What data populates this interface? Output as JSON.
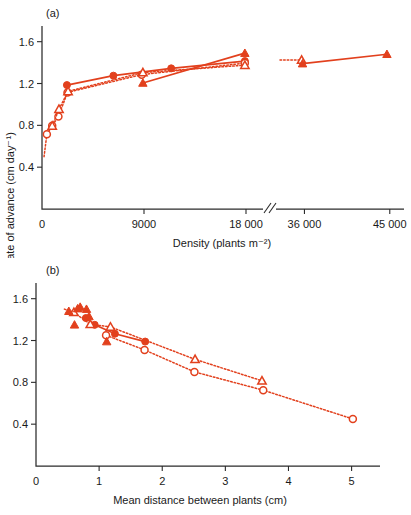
{
  "figure": {
    "accent_color": "#e2401d",
    "axis_color": "#2b2b2b",
    "shared_ylabel": "Rate of advance (cm day⁻¹)"
  },
  "panel_a": {
    "label": "(a)",
    "xlabel": "Density (plants m⁻²)",
    "ylabel": "Rate of advance (cm day⁻¹)",
    "xticks": [
      "0",
      "9000",
      "18 000",
      "36 000",
      "45 000"
    ],
    "yticks": [
      "0.4",
      "0.8",
      "1.2",
      "1.6"
    ]
  },
  "panel_b": {
    "label": "(b)",
    "xlabel": "Mean distance between plants (cm)",
    "ylabel": "Rate of advance (cm day⁻¹)",
    "xticks": [
      "0",
      "1",
      "2",
      "3",
      "4",
      "5"
    ],
    "yticks": [
      "0.4",
      "0.8",
      "1.2",
      "1.6"
    ]
  },
  "chart_data": [
    {
      "type": "scatter",
      "panel": "(a)",
      "title": "",
      "xlabel": "Density (plants m⁻²)",
      "ylabel": "Rate of advance (cm day⁻¹)",
      "xlim": [
        0,
        19500
      ],
      "xlim_right_segment": [
        33000,
        46500
      ],
      "ylim": [
        0,
        1.75
      ],
      "ytick_values": [
        0.4,
        0.8,
        1.2,
        1.6
      ],
      "xtick_values": [
        0,
        9000,
        18000,
        36000,
        45000
      ],
      "axis_break": true,
      "axis_break_between": [
        19500,
        33000
      ],
      "grid": false,
      "legend": "none",
      "series": [
        {
          "name": "filled-circles",
          "marker": "filled circle",
          "line": "solid",
          "points": [
            {
              "x": 2200,
              "y": 1.185
            },
            {
              "x": 6300,
              "y": 1.275
            },
            {
              "x": 11400,
              "y": 1.345
            },
            {
              "x": 17900,
              "y": 1.415
            }
          ]
        },
        {
          "name": "open-circles",
          "marker": "open circle",
          "line": "dotted",
          "points": [
            {
              "x": 430,
              "y": 0.715
            },
            {
              "x": 900,
              "y": 0.795
            },
            {
              "x": 1450,
              "y": 0.885
            },
            {
              "x": 2250,
              "y": 1.115
            },
            {
              "x": 8800,
              "y": 1.285
            },
            {
              "x": 17900,
              "y": 1.395
            }
          ]
        },
        {
          "name": "open-triangles",
          "marker": "open triangle",
          "line": "dotted",
          "points": [
            {
              "x": 900,
              "y": 0.795
            },
            {
              "x": 1500,
              "y": 0.955
            },
            {
              "x": 2300,
              "y": 1.125
            },
            {
              "x": 8900,
              "y": 1.305
            },
            {
              "x": 17900,
              "y": 1.375
            },
            {
              "x": 35700,
              "y": 1.425
            }
          ]
        },
        {
          "name": "filled-triangles",
          "marker": "filled triangle",
          "line": "solid",
          "points": [
            {
              "x": 8900,
              "y": 1.205
            },
            {
              "x": 17900,
              "y": 1.49
            },
            {
              "x": 35800,
              "y": 1.39
            },
            {
              "x": 44700,
              "y": 1.48
            }
          ]
        }
      ]
    },
    {
      "type": "scatter",
      "panel": "(b)",
      "title": "",
      "xlabel": "Mean distance between plants (cm)",
      "ylabel": "Rate of advance (cm day⁻¹)",
      "xlim": [
        0,
        5.45
      ],
      "ylim": [
        0,
        1.75
      ],
      "ytick_values": [
        0.4,
        0.8,
        1.2,
        1.6
      ],
      "xtick_values": [
        0,
        1,
        2,
        3,
        4,
        5
      ],
      "grid": false,
      "legend": "none",
      "series": [
        {
          "name": "filled-circles",
          "marker": "filled circle",
          "line": "solid",
          "points": [
            {
              "x": 0.79,
              "y": 1.415
            },
            {
              "x": 0.93,
              "y": 1.35
            },
            {
              "x": 1.25,
              "y": 1.265
            },
            {
              "x": 1.73,
              "y": 1.19
            }
          ]
        },
        {
          "name": "open-circles",
          "marker": "open circle",
          "line": "dotted",
          "points": [
            {
              "x": 1.11,
              "y": 1.25
            },
            {
              "x": 1.72,
              "y": 1.11
            },
            {
              "x": 2.51,
              "y": 0.9
            },
            {
              "x": 3.6,
              "y": 0.725
            },
            {
              "x": 5.02,
              "y": 0.45
            }
          ]
        },
        {
          "name": "open-triangles",
          "marker": "open triangle",
          "line": "dotted",
          "points": [
            {
              "x": 0.6,
              "y": 1.47
            },
            {
              "x": 0.86,
              "y": 1.355
            },
            {
              "x": 1.18,
              "y": 1.33
            },
            {
              "x": 2.52,
              "y": 1.02
            },
            {
              "x": 3.58,
              "y": 0.815
            }
          ]
        },
        {
          "name": "filled-triangles",
          "marker": "filled triangle",
          "line": "none",
          "points": [
            {
              "x": 0.52,
              "y": 1.48
            },
            {
              "x": 0.61,
              "y": 1.35
            },
            {
              "x": 0.66,
              "y": 1.505
            },
            {
              "x": 0.7,
              "y": 1.52
            },
            {
              "x": 0.8,
              "y": 1.5
            },
            {
              "x": 0.84,
              "y": 1.43
            },
            {
              "x": 1.12,
              "y": 1.19
            }
          ]
        }
      ]
    }
  ]
}
